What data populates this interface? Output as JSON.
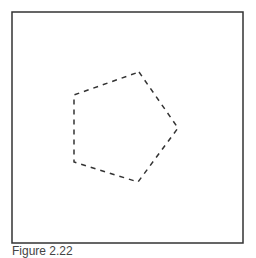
{
  "figure": {
    "frame": {
      "x": 12,
      "y": 12,
      "width": 231,
      "height": 231,
      "stroke": "#333333"
    },
    "pentagon": {
      "points": [
        [
          139,
          72
        ],
        [
          178,
          128
        ],
        [
          138,
          182
        ],
        [
          74,
          162
        ],
        [
          74,
          95
        ]
      ],
      "stroke": "#333333",
      "dash": "5,5"
    },
    "caption": "Figure 2.22"
  }
}
